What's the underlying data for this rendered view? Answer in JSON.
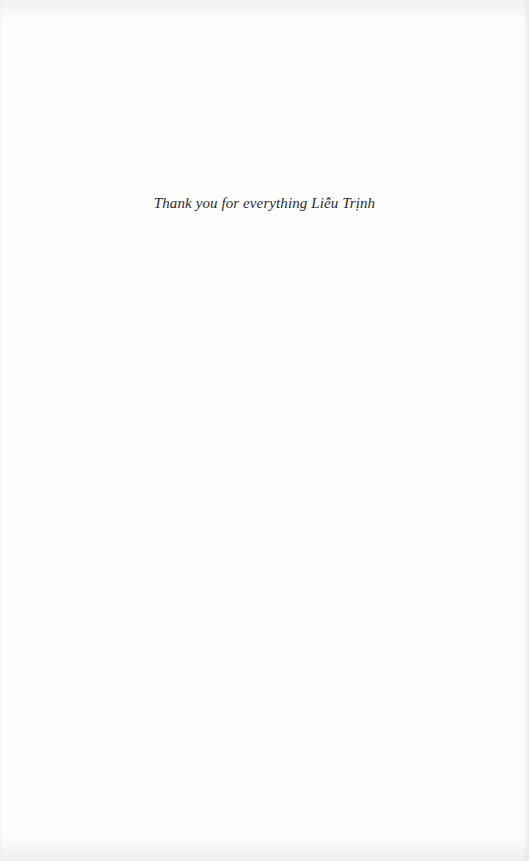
{
  "page": {
    "type": "dedication",
    "dedication_text": "Thank you for everything Liễu Trịnh"
  },
  "colors": {
    "background": "#fefefe",
    "text": "#2a2a2a"
  }
}
